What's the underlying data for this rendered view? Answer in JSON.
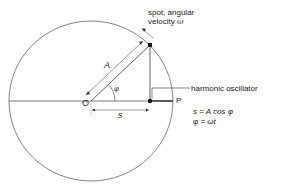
{
  "diagram": {
    "labels": {
      "spot_line1": "spot, angular",
      "spot_line2": "velocity ",
      "omega": "ω",
      "amplitude": "A",
      "angle": "φ",
      "origin": "O",
      "point_p": "P",
      "displacement": "s",
      "oscillator": "harmonic oscillator"
    },
    "equations": {
      "eq1": "s = A cos φ",
      "eq2": "φ = ωt"
    },
    "geometry": {
      "center": [
        91,
        101
      ],
      "radius_x": 82,
      "radius_y": 80,
      "spot": [
        150,
        45
      ],
      "projection": [
        150,
        101
      ],
      "p_point": [
        173,
        101
      ]
    },
    "colors": {
      "line": "#555555",
      "dot": "#111111",
      "text": "#222222"
    }
  }
}
